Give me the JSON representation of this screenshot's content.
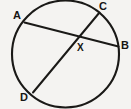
{
  "figure": {
    "kind": "circle-with-intersecting-chords",
    "background_color": "#f4f3f1",
    "stroke_color": "#1a1917",
    "label_color": "#161513"
  },
  "circle": {
    "name": "circle-outline",
    "center_x": 65.5,
    "center_y": 54,
    "radius": 53.5,
    "stroke_width": 2.1
  },
  "chords": [
    {
      "name": "chord-ab",
      "from": "A",
      "to": "B",
      "x1": 24.5,
      "y1": 22.5,
      "x2": 118.5,
      "y2": 46.5,
      "stroke_width": 2.0
    },
    {
      "name": "chord-cd",
      "from": "C",
      "to": "D",
      "x1": 99.5,
      "y1": 12.5,
      "x2": 33.0,
      "y2": 92.5,
      "stroke_width": 2.0
    }
  ],
  "intersection": {
    "name": "point-x",
    "label": "X",
    "x": 78,
    "y": 38
  },
  "labels": {
    "a": "A",
    "b": "B",
    "c": "C",
    "d": "D",
    "x": "X"
  }
}
